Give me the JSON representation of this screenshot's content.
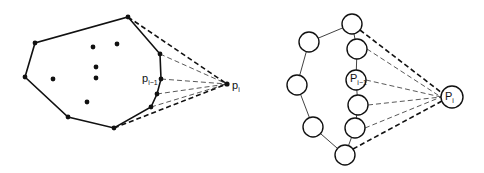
{
  "left_diagram": {
    "hull": [
      [
        128,
        17
      ],
      [
        160,
        54
      ],
      [
        161,
        79
      ],
      [
        157,
        94
      ],
      [
        151,
        107
      ],
      [
        114,
        128
      ],
      [
        68,
        117
      ],
      [
        25,
        77
      ],
      [
        35,
        43
      ]
    ],
    "interior_points": [
      [
        93,
        47
      ],
      [
        117,
        44
      ],
      [
        96,
        67
      ],
      [
        96,
        78
      ],
      [
        53,
        79
      ],
      [
        87,
        102
      ]
    ],
    "new_point": [
      227,
      84
    ],
    "tangent_bold": [
      [
        128,
        17
      ],
      [
        114,
        128
      ]
    ],
    "tangent_thin": [
      [
        160,
        54
      ],
      [
        161,
        79
      ],
      [
        157,
        94
      ],
      [
        151,
        107
      ]
    ],
    "labels": {
      "p_prev": "p",
      "p_prev_sub": "i−1",
      "p_new": "p",
      "p_new_sub": "i"
    }
  },
  "right_diagram": {
    "chain": [
      [
        352,
        24
      ],
      [
        309,
        42
      ],
      [
        297,
        85
      ],
      [
        313,
        127
      ],
      [
        345,
        155
      ]
    ],
    "right_column": [
      [
        357,
        49
      ],
      [
        356,
        80
      ],
      [
        358,
        105
      ],
      [
        355,
        128
      ]
    ],
    "new_point": [
      452,
      97
    ],
    "labels": {
      "p_prev": "P",
      "p_prev_sub": "i−1",
      "p_new": "P",
      "p_new_sub": "i"
    }
  },
  "colors": {
    "ink": "#111111",
    "background": "#ffffff"
  }
}
